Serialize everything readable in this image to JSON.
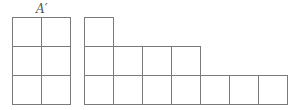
{
  "figure": {
    "label": "A′",
    "line_color": "#7a7a7a",
    "cell_size": 29,
    "left_shape": {
      "name": "A-prime",
      "origin": [
        12,
        17
      ],
      "rows": [
        {
          "row": 0,
          "cells": 2
        },
        {
          "row": 1,
          "cells": 2
        },
        {
          "row": 2,
          "cells": 2
        }
      ],
      "total_squares": 6
    },
    "right_shape": {
      "origin": [
        84,
        17
      ],
      "rows": [
        {
          "row": 0,
          "cells": 1
        },
        {
          "row": 1,
          "cells": 4
        },
        {
          "row": 2,
          "cells": 7
        }
      ],
      "total_squares": 12
    }
  }
}
